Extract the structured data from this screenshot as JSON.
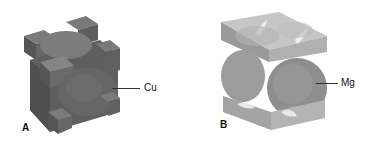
{
  "panels": [
    {
      "letter": "A",
      "label": "Cu",
      "structure": "face-centered cubic unit cell (cut-away corner atoms, face atoms)",
      "colors": {
        "dark": "#5a5a5a",
        "mid": "#6e6e6e",
        "light": "#8a8a8a"
      }
    },
    {
      "letter": "B",
      "label": "Mg",
      "structure": "hexagonal close-packed unit cell section",
      "colors": {
        "dark": "#8a8a8a",
        "mid": "#a2a2a2",
        "light": "#c4c4c4"
      }
    }
  ]
}
